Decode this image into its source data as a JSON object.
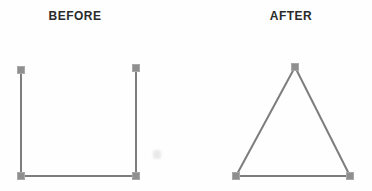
{
  "figure": {
    "background_color": "#fefefe",
    "line_color": "#7d7d7d",
    "handle_color": "#8f8f8f",
    "handle_border_color": "#a8a8a8",
    "label_color": "#2b2b2b",
    "line_width": 2,
    "handle_size": 7,
    "panels": [
      {
        "label": "BEFORE",
        "shape": "open-square",
        "lines": [
          {
            "x1": 21,
            "y1": 70,
            "x2": 21,
            "y2": 176
          },
          {
            "x1": 136,
            "y1": 68,
            "x2": 136,
            "y2": 176
          },
          {
            "x1": 21,
            "y1": 176,
            "x2": 136,
            "y2": 176
          }
        ],
        "handles": [
          {
            "x": 21,
            "y": 70
          },
          {
            "x": 136,
            "y": 68
          },
          {
            "x": 21,
            "y": 176
          },
          {
            "x": 136,
            "y": 176
          }
        ]
      },
      {
        "label": "AFTER",
        "shape": "triangle",
        "lines": [
          {
            "x1": 295,
            "y1": 67,
            "x2": 236,
            "y2": 176
          },
          {
            "x1": 295,
            "y1": 67,
            "x2": 350,
            "y2": 176
          },
          {
            "x1": 236,
            "y1": 176,
            "x2": 350,
            "y2": 176
          }
        ],
        "handles": [
          {
            "x": 295,
            "y": 67
          },
          {
            "x": 236,
            "y": 176
          },
          {
            "x": 350,
            "y": 176
          }
        ]
      }
    ]
  }
}
